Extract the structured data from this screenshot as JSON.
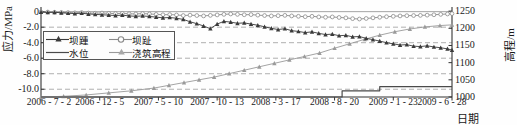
{
  "chart_data": {
    "type": "line",
    "title": "",
    "xlabel": "日期",
    "ylabel": "应力/MPa",
    "ylabel_right": "高程/m",
    "grid": true,
    "legend_position": "inside-left",
    "xlim": [
      0,
      1092
    ],
    "ylim": [
      -11.0,
      0.6
    ],
    "ylim_right": [
      1000,
      1262
    ],
    "xtick_labels": [
      "2006 - 7 - 2",
      "2006 - 12 - 5",
      "2007 - 5 - 10",
      "2007 - 10 - 13",
      "2008 - 3 - 17",
      "2008 - 8 - 20",
      "2009 - 1 - 23",
      "2009 - 6 - 28"
    ],
    "xtick_positions": [
      0,
      156,
      312,
      468,
      624,
      780,
      936,
      1092
    ],
    "ytick_labels_left": [
      "0",
      "-2.0",
      "-4.0",
      "-6.0",
      "-8.0",
      "-10.0"
    ],
    "ytick_values_left": [
      0,
      -2.0,
      -4.0,
      -6.0,
      -8.0,
      -10.0
    ],
    "ytick_labels_right": [
      "1250",
      "1200",
      "1150",
      "1100",
      "1050",
      "1000"
    ],
    "ytick_values_right": [
      1250,
      1200,
      1150,
      1100,
      1050,
      1000
    ],
    "series": [
      {
        "name": "坝踵",
        "legend_label": "坝踵",
        "axis": "left",
        "unit": "MPa",
        "color": "#3a3a3a",
        "marker": "triangle",
        "x": [
          0,
          18,
          36,
          54,
          72,
          90,
          108,
          126,
          144,
          162,
          180,
          198,
          216,
          234,
          252,
          270,
          288,
          306,
          324,
          342,
          360,
          378,
          396,
          414,
          432,
          450,
          468,
          486,
          504,
          522,
          540,
          558,
          576,
          594,
          612,
          630,
          648,
          666,
          684,
          702,
          720,
          738,
          756,
          774,
          792,
          810,
          828,
          846,
          864,
          882,
          900,
          918,
          936,
          954,
          972,
          990,
          1008,
          1026,
          1044,
          1062,
          1080,
          1092
        ],
        "values": [
          -0.05,
          -0.1,
          -0.08,
          -0.15,
          -0.2,
          -0.25,
          -0.2,
          -0.3,
          -0.35,
          -0.4,
          -0.45,
          -0.5,
          -0.45,
          -0.55,
          -0.6,
          -0.55,
          -0.62,
          -0.7,
          -0.8,
          -0.75,
          -0.85,
          -1.0,
          -1.3,
          -1.55,
          -1.85,
          -2.2,
          -1.6,
          -1.25,
          -1.35,
          -1.5,
          -1.45,
          -1.6,
          -1.75,
          -1.95,
          -2.15,
          -2.3,
          -2.2,
          -2.45,
          -2.55,
          -2.7,
          -2.6,
          -2.8,
          -2.95,
          -2.9,
          -3.1,
          -3.05,
          -3.25,
          -3.2,
          -3.45,
          -3.6,
          -3.8,
          -4.0,
          -4.15,
          -4.3,
          -4.25,
          -4.45,
          -4.5,
          -4.4,
          -4.55,
          -4.65,
          -4.8,
          -4.95
        ]
      },
      {
        "name": "坝趾",
        "legend_label": "坝趾",
        "axis": "left",
        "unit": "MPa",
        "color": "#8a8a8a",
        "marker": "circle",
        "x": [
          0,
          18,
          36,
          54,
          72,
          90,
          108,
          126,
          144,
          162,
          180,
          198,
          216,
          234,
          252,
          270,
          288,
          306,
          324,
          342,
          360,
          378,
          396,
          414,
          432,
          450,
          468,
          486,
          504,
          522,
          540,
          558,
          576,
          594,
          612,
          630,
          648,
          666,
          684,
          702,
          720,
          738,
          756,
          774,
          792,
          810,
          828,
          846,
          864,
          882,
          900,
          918,
          936,
          954,
          972,
          990,
          1008,
          1026,
          1044,
          1062,
          1080,
          1092
        ],
        "values": [
          -0.05,
          -0.05,
          -0.08,
          -0.1,
          -0.12,
          -0.15,
          -0.12,
          -0.18,
          -0.2,
          -0.18,
          -0.22,
          -0.25,
          -0.22,
          -0.28,
          -0.3,
          -0.25,
          -0.3,
          -0.35,
          -0.4,
          -0.38,
          -0.42,
          -0.5,
          -0.45,
          -0.5,
          -0.55,
          -0.48,
          -0.42,
          -0.35,
          -0.3,
          -0.35,
          -0.4,
          -0.38,
          -0.45,
          -0.5,
          -0.55,
          -0.52,
          -0.48,
          -0.55,
          -0.6,
          -0.65,
          -0.6,
          -0.68,
          -0.72,
          -0.68,
          -0.75,
          -0.8,
          -0.9,
          -0.95,
          -0.88,
          -0.8,
          -0.72,
          -0.65,
          -0.6,
          -0.55,
          -0.52,
          -0.5,
          -0.48,
          -0.45,
          -0.4,
          -0.35,
          -0.3,
          -0.25
        ]
      },
      {
        "name": "水位",
        "legend_label": "水位",
        "axis": "right",
        "unit": "m",
        "color": "#4a4a4a",
        "marker": "none",
        "x": [
          0,
          600,
          780,
          800,
          800,
          900,
          900,
          1092
        ],
        "values": [
          1000,
          1000,
          1000,
          1000,
          1018,
          1018,
          1030,
          1030
        ]
      },
      {
        "name": "浇筑高程",
        "legend_label": "浇筑高程",
        "axis": "right",
        "unit": "m",
        "color": "#9a9a9a",
        "marker": "triangle",
        "x": [
          0,
          60,
          120,
          180,
          240,
          300,
          340,
          380,
          420,
          460,
          500,
          540,
          580,
          620,
          660,
          700,
          740,
          780,
          820,
          860,
          900,
          940,
          980,
          1020,
          1060,
          1092
        ],
        "values": [
          1000,
          1002,
          1006,
          1012,
          1018,
          1026,
          1034,
          1042,
          1050,
          1058,
          1068,
          1078,
          1088,
          1098,
          1108,
          1118,
          1128,
          1142,
          1155,
          1168,
          1180,
          1190,
          1198,
          1204,
          1208,
          1210
        ]
      }
    ]
  },
  "colors": {
    "axis": "#333333",
    "grid": "#9b9b9b",
    "background": "#fefefe",
    "legend_border": "#555555"
  }
}
